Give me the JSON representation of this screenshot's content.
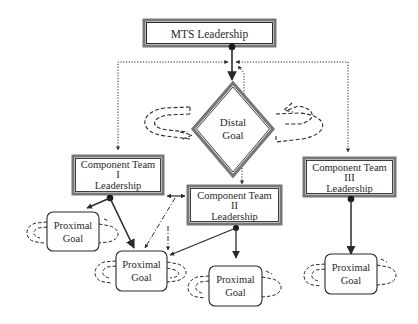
{
  "diagram": {
    "title_node": {
      "label": "MTS Leadership"
    },
    "distal_goal": {
      "line1": "Distal",
      "line2": "Goal"
    },
    "component_teams": [
      {
        "line1": "Component Team",
        "line2": "I",
        "line3": "Leadership"
      },
      {
        "line1": "Component Team",
        "line2": "II",
        "line3": "Leadership"
      },
      {
        "line1": "Component Team",
        "line2": "III",
        "line3": "Leadership"
      }
    ],
    "proximal_goals": [
      {
        "line1": "Proximal",
        "line2": "Goal"
      },
      {
        "line1": "Proximal",
        "line2": "Goal"
      },
      {
        "line1": "Proximal",
        "line2": "Goal"
      },
      {
        "line1": "Proximal",
        "line2": "Goal"
      }
    ],
    "colors": {
      "stroke": "#2a2a2a",
      "double_border_fill": "#777777",
      "background": "#ffffff"
    },
    "legend_semantics": {
      "solid_arrow": "leadership influence",
      "dotted_arrow": "MTS leadership coordination",
      "dash_dot_arrow": "cross-team coordination",
      "dashed_loop": "goal cycle"
    }
  }
}
